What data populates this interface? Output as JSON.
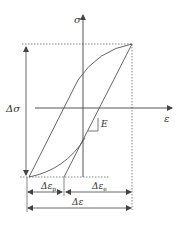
{
  "diagram": {
    "axes": {
      "y_label": "σ",
      "x_label": "ε"
    },
    "labels": {
      "stress_range": "Δσ",
      "modulus": "E",
      "plastic_strain": "Δε",
      "plastic_sub": "p",
      "elastic_strain": "Δε",
      "elastic_sub": "e",
      "total_strain": "Δε"
    },
    "colors": {
      "line": "#555555",
      "dotted": "#666666",
      "text": "#333333"
    }
  }
}
